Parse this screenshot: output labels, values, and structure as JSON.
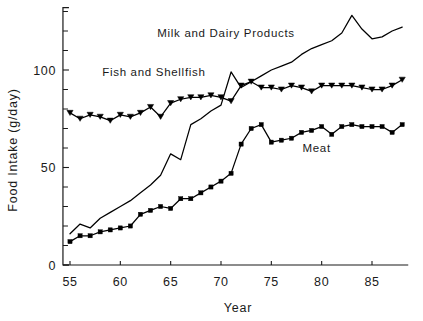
{
  "chart_data": {
    "type": "line",
    "title": "",
    "xlabel": "Year",
    "ylabel": "Food  Intake (g/day)",
    "xlim": [
      54.3,
      88.6
    ],
    "ylim": [
      0,
      132
    ],
    "grid": false,
    "legend_position": "inline-annotations",
    "x_tick_labels": [
      "55",
      "60",
      "65",
      "70",
      "75",
      "80",
      "85"
    ],
    "x_tick_values": [
      55,
      60,
      65,
      70,
      75,
      80,
      85
    ],
    "y_tick_labels": [
      "0",
      "50",
      "100"
    ],
    "y_tick_values": [
      0,
      50,
      100
    ],
    "y_minor_ticks": [
      10,
      20,
      30,
      40,
      60,
      70,
      80,
      90,
      110,
      120,
      130
    ],
    "x": [
      55,
      56,
      57,
      58,
      59,
      60,
      61,
      62,
      63,
      64,
      65,
      66,
      67,
      68,
      69,
      70,
      71,
      72,
      73,
      74,
      75,
      76,
      77,
      78,
      79,
      80,
      81,
      82,
      83,
      84,
      85,
      86,
      87,
      88
    ],
    "series": [
      {
        "name": "Milk and Dairy Products",
        "marker": "none",
        "label_x": 70.5,
        "label_y": 117,
        "values": [
          16,
          21,
          19,
          24,
          27,
          30,
          33,
          37,
          41,
          46,
          57,
          54,
          72,
          75,
          79,
          82,
          99,
          91,
          94,
          97,
          100,
          102,
          104,
          108,
          111,
          113,
          115,
          119,
          128,
          121,
          116,
          117,
          120,
          122
        ]
      },
      {
        "name": "Fish and Shellfish",
        "marker": "triangle",
        "label_x": 58.2,
        "label_y": 97,
        "values": [
          78,
          75,
          77,
          76,
          74,
          77,
          76,
          78,
          81,
          76,
          83,
          85,
          86,
          86,
          87,
          86,
          84,
          92,
          94,
          91,
          91,
          90,
          92,
          91,
          89,
          92,
          92,
          92,
          92,
          91,
          90,
          90,
          92,
          95
        ]
      },
      {
        "name": "Meat",
        "marker": "square",
        "label_x": 79.5,
        "label_y": 58,
        "values": [
          12,
          15,
          15,
          17,
          18,
          19,
          20,
          26,
          28,
          30,
          29,
          34,
          34,
          37,
          40,
          43,
          47,
          62,
          70,
          72,
          63,
          64,
          65,
          68,
          69,
          71,
          67,
          71,
          72,
          71,
          71,
          71,
          68,
          72
        ]
      }
    ]
  }
}
